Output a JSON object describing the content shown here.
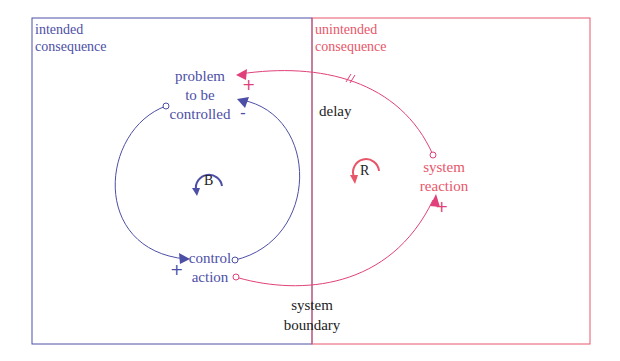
{
  "regions": {
    "intended": {
      "label_line1": "intended",
      "label_line2": "consequence",
      "color": "#4d4fa6"
    },
    "unintended": {
      "label_line1": "unintended",
      "label_line2": "consequence",
      "color": "#e8566a"
    }
  },
  "nodes": {
    "problem": {
      "line1": "problem",
      "line2": "to be",
      "line3": "controlled"
    },
    "control_action": {
      "line1": "control",
      "line2": "action"
    },
    "system_reaction": {
      "line1": "system",
      "line2": "reaction"
    }
  },
  "loops": {
    "balancing": {
      "label": "B"
    },
    "reinforcing": {
      "label": "R"
    }
  },
  "annotations": {
    "delay": "delay",
    "boundary_line1": "system",
    "boundary_line2": "boundary"
  },
  "polarities": {
    "problem_from_control": "-",
    "control_from_problem": "+",
    "problem_from_reaction": "+",
    "reaction_from_control": "+"
  },
  "colors": {
    "blue": "#4d4fa6",
    "red": "#e8566a",
    "pink": "#e0417a"
  }
}
